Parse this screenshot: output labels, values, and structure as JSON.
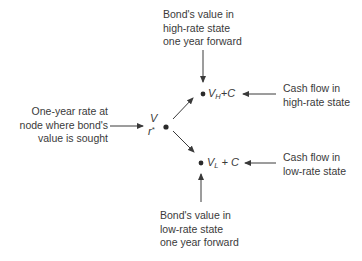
{
  "diagram": {
    "type": "binomial-interest-rate-tree-node",
    "nodes": {
      "root": {
        "value": "V",
        "rate": "r",
        "rate_suffix": "*"
      },
      "high": {
        "value": "V",
        "sub": "H",
        "plus": "+C"
      },
      "low": {
        "value": "V",
        "sub": "L",
        "plus": " + C"
      }
    },
    "labels": {
      "top_1": "Bond's value in",
      "top_2": "high-rate state",
      "top_3": "one year forward",
      "left_1": "One-year rate at",
      "left_2": "node where bond's",
      "left_3": "value is sought",
      "right_high_1": "Cash flow in",
      "right_high_2": "high-rate state",
      "right_low_1": "Cash flow in",
      "right_low_2": "low-rate state",
      "bottom_1": "Bond's value in",
      "bottom_2": "low-rate state",
      "bottom_3": "one year forward"
    },
    "colors": {
      "text": "#3a3a3a",
      "line": "#3a3a3a"
    }
  }
}
